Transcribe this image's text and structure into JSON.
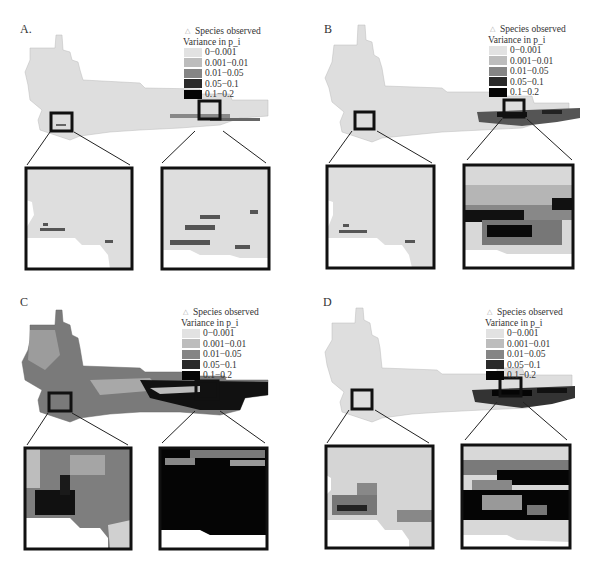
{
  "figure": {
    "legend": {
      "species_label": "Species observed",
      "title": "Variance in p_i",
      "classes": [
        {
          "label": "0−0.001",
          "color": "#e2e2e2"
        },
        {
          "label": "0.001−0.01",
          "color": "#bdbdbd"
        },
        {
          "label": "0.01−0.05",
          "color": "#858585"
        },
        {
          "label": "0.05−0.1",
          "color": "#2a2a2a"
        },
        {
          "label": "0.1−0.2",
          "color": "#050505"
        }
      ]
    },
    "panels": [
      {
        "id": "A",
        "label": "A.",
        "map_fill": "#dedede",
        "west_inset_fill": "#dedede",
        "east_inset_fill": "#dedede"
      },
      {
        "id": "B",
        "label": "B",
        "map_fill": "#dedede",
        "west_inset_fill": "#dedede",
        "east_inset_fill": "#9a9a9a"
      },
      {
        "id": "C",
        "label": "C",
        "map_fill": "#7a7a7a",
        "west_inset_fill": "#7e7e7e",
        "east_inset_fill": "#050505"
      },
      {
        "id": "D",
        "label": "D",
        "map_fill": "#dedede",
        "west_inset_fill": "#d0d0d0",
        "east_inset_fill": "#3a3a3a"
      }
    ]
  }
}
